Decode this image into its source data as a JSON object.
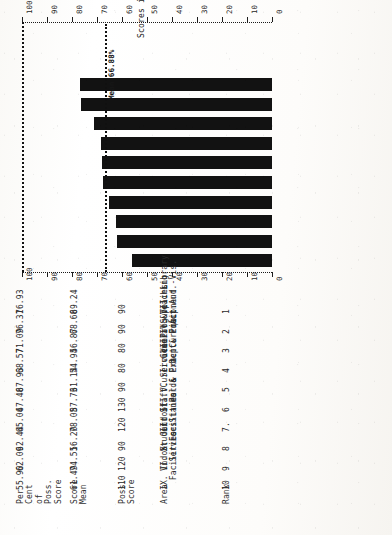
{
  "document": {
    "kind": "scanned-page",
    "orientation": "rotated-90-ccw"
  },
  "chart_data": {
    "type": "bar",
    "title": "",
    "xlabel": "",
    "ylabel": "Scores in Per Cent",
    "ylim": [
      0,
      100
    ],
    "grid": false,
    "legend": null,
    "orientation": "rotated",
    "tick_labels": [
      "0",
      "10",
      "20",
      "30",
      "40",
      "50",
      "60",
      "70",
      "80",
      "90",
      "100"
    ],
    "tick_values": [
      0,
      10,
      20,
      30,
      40,
      50,
      60,
      70,
      80,
      90,
      100
    ],
    "axis_title": "Scores in Per Cent",
    "mean_line": {
      "value": 66.88,
      "label": "Mean 66.88%"
    },
    "categories": [
      "VII. Library Aud.-Vis.",
      "IV. Teaching Act",
      "VIII. Supplies & Equipment",
      "I. General & Dept. Pract.",
      "V. Service Prog & Ext. Curric.",
      "III. Curriculum Pol.& Pract.",
      "II. Staff Standards",
      "X. Outdoor Facilities",
      "VI. Student Services",
      "IX. Indoor Facilities"
    ],
    "values": [
      76.93,
      76.31,
      71.09,
      68.57,
      67.93,
      67.48,
      65.04,
      62.44,
      62.09,
      55.9
    ],
    "bar_color": "#121212"
  },
  "table": {
    "headers": {
      "rank": "Rank",
      "area": "Area",
      "poss_score": "Poss.\nScore",
      "score_mean": "Score\nMean",
      "percent": "Per\nCent\nof\nPoss.\nScore"
    },
    "rows": [
      {
        "rank": "1",
        "area": "VII. Library\n  Aud.-Vis.",
        "poss_score": "90",
        "score_mean": "69.24",
        "percent": "76.93"
      },
      {
        "rank": "2",
        "area": "IV. Teaching\n  Act",
        "poss_score": "90",
        "score_mean": "68.68",
        "percent": "76.31"
      },
      {
        "rank": "3",
        "area": "VIII. Supplies\n  & Equipment",
        "poss_score": "80",
        "score_mean": "56.87",
        "percent": "71.09"
      },
      {
        "rank": "4",
        "area": "I. General &\n  Dept. Pract.",
        "poss_score": "80",
        "score_mean": "54.94",
        "percent": "68.57"
      },
      {
        "rank": "5",
        "area": "V. Service Prog\n  & Ext. Curric.",
        "poss_score": "90",
        "score_mean": "61.14",
        "percent": "67.93"
      },
      {
        "rank": "6",
        "area": "III. Curriculum\n  Pol.& Pract.",
        "poss_score": "130",
        "score_mean": "87.73",
        "percent": "67.48"
      },
      {
        "rank": "7.",
        "area": "II. Staff\n  Standards",
        "poss_score": "120",
        "score_mean": "78.05",
        "percent": "65.04"
      },
      {
        "rank": "8",
        "area": "X. Outdoor\n  Facilities",
        "poss_score": "90",
        "score_mean": "56.20",
        "percent": "62.44"
      },
      {
        "rank": "9",
        "area": "VI. Student\n  Services",
        "poss_score": "120",
        "score_mean": "74.51",
        "percent": "62.09"
      },
      {
        "rank": "10",
        "area": "IX. Indoor\n  Facilities",
        "poss_score": "110",
        "score_mean": "61.49",
        "percent": "55.90"
      }
    ]
  }
}
